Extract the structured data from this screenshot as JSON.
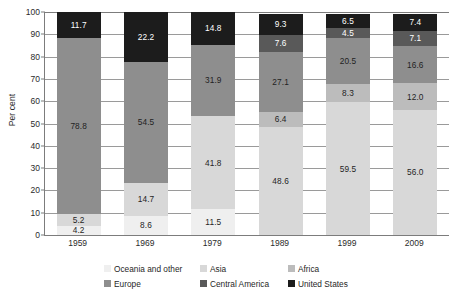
{
  "chart_data": {
    "type": "bar",
    "subtype": "stacked-bar-100",
    "title": "",
    "xlabel": "",
    "ylabel": "Per cent",
    "ylim": [
      0,
      100
    ],
    "ytick_step": 10,
    "grid": true,
    "legend_position": "bottom",
    "categories": [
      "1959",
      "1969",
      "1979",
      "1989",
      "1999",
      "2009"
    ],
    "yticks": [
      "0",
      "10",
      "20",
      "30",
      "40",
      "50",
      "60",
      "70",
      "80",
      "90",
      "100"
    ],
    "series": [
      {
        "name": "Oceania and other",
        "color": "#efefef",
        "text_color": "#1f1f1f",
        "values": [
          4.2,
          8.6,
          11.5,
          0.0,
          0.0,
          0.0
        ],
        "labels": [
          "4.2",
          "8.6",
          "11.5",
          "",
          "",
          ""
        ]
      },
      {
        "name": "Asia",
        "color": "#d8d8d8",
        "text_color": "#1f1f1f",
        "values": [
          5.2,
          14.7,
          41.8,
          48.6,
          59.5,
          56.0
        ],
        "labels": [
          "5.2",
          "14.7",
          "41.8",
          "48.6",
          "59.5",
          "56.0"
        ]
      },
      {
        "name": "Africa",
        "color": "#bcbcbc",
        "text_color": "#1f1f1f",
        "values": [
          0.0,
          0.0,
          0.0,
          6.4,
          8.3,
          12.0
        ],
        "labels": [
          "",
          "",
          "",
          "6.4",
          "8.3",
          "12.0"
        ]
      },
      {
        "name": "Europe",
        "color": "#8e8e8e",
        "text_color": "#1f1f1f",
        "values": [
          78.8,
          54.5,
          31.9,
          27.1,
          20.5,
          16.6
        ],
        "labels": [
          "78.8",
          "54.5",
          "31.9",
          "27.1",
          "20.5",
          "16.6"
        ]
      },
      {
        "name": "Central America",
        "color": "#595959",
        "text_color": "#ffffff",
        "values": [
          0.0,
          0.0,
          0.0,
          7.6,
          4.5,
          7.1
        ],
        "labels": [
          "",
          "",
          "",
          "7.6",
          "4.5",
          "7.1"
        ]
      },
      {
        "name": "United States",
        "color": "#1c1c1c",
        "text_color": "#ffffff",
        "values": [
          11.7,
          22.2,
          14.8,
          9.3,
          6.5,
          7.4
        ],
        "labels": [
          "11.7",
          "22.2",
          "14.8",
          "9.3",
          "6.5",
          "7.4"
        ]
      }
    ]
  },
  "axis": {
    "y_title": "Per cent"
  },
  "legend": {
    "items": [
      {
        "label": "Oceania and other",
        "color": "#efefef"
      },
      {
        "label": "Asia",
        "color": "#d8d8d8"
      },
      {
        "label": "Africa",
        "color": "#bcbcbc"
      },
      {
        "label": "Europe",
        "color": "#8e8e8e"
      },
      {
        "label": "Central America",
        "color": "#595959"
      },
      {
        "label": "United States",
        "color": "#1c1c1c"
      }
    ]
  }
}
